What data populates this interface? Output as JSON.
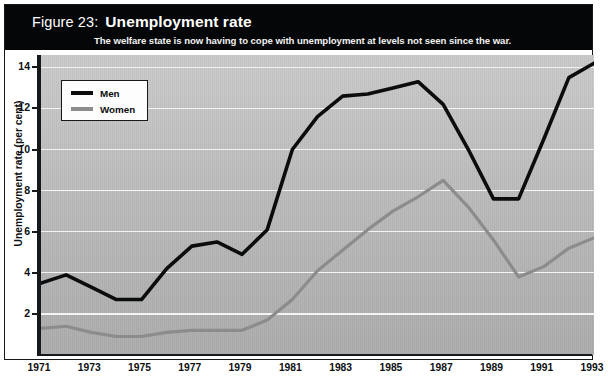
{
  "figure": {
    "number_label": "Figure 23:",
    "title": "Unemployment rate",
    "subtitle": "The welfare state is now having to cope with unemployment at levels not seen since the war."
  },
  "legend": {
    "position": "top-left",
    "entries": [
      {
        "label": "Men",
        "color": "#0a0c0d"
      },
      {
        "label": "Women",
        "color": "#8c8c8c"
      }
    ]
  },
  "axes": {
    "y_title": "Unemployment rate (per cent)",
    "y_ticks": [
      "2",
      "4",
      "6",
      "8",
      "10",
      "12",
      "14"
    ],
    "x_ticks": [
      "1971",
      "1973",
      "1975",
      "1977",
      "1979",
      "1981",
      "1983",
      "1985",
      "1987",
      "1989",
      "1991",
      "1993"
    ]
  },
  "chart_data": {
    "type": "line",
    "title": "Unemployment rate",
    "subtitle": "The welfare state is now having to cope with unemployment at levels not seen since the war.",
    "xlabel": "",
    "ylabel": "Unemployment rate (per cent)",
    "x": [
      1971,
      1972,
      1973,
      1974,
      1975,
      1976,
      1977,
      1978,
      1979,
      1980,
      1981,
      1982,
      1983,
      1984,
      1985,
      1986,
      1987,
      1988,
      1989,
      1990,
      1991,
      1992,
      1993
    ],
    "xlim": [
      1971,
      1993
    ],
    "ylim": [
      0,
      14.6
    ],
    "y_tick_values": [
      2,
      4,
      6,
      8,
      10,
      12,
      14
    ],
    "grid": true,
    "grid_color": "#f4f4f4",
    "series": [
      {
        "name": "Men",
        "color": "#0a0c0d",
        "values": [
          3.5,
          3.9,
          3.3,
          2.7,
          2.7,
          4.2,
          5.3,
          5.5,
          4.9,
          6.1,
          10.0,
          11.6,
          12.6,
          12.7,
          13.0,
          13.3,
          12.2,
          10.0,
          7.6,
          7.6,
          10.5,
          13.5,
          14.2
        ]
      },
      {
        "name": "Women",
        "color": "#8c8c8c",
        "values": [
          1.3,
          1.4,
          1.1,
          0.9,
          0.9,
          1.1,
          1.2,
          1.2,
          1.2,
          1.7,
          2.7,
          4.1,
          5.1,
          6.1,
          7.0,
          7.7,
          8.5,
          7.2,
          5.6,
          3.8,
          4.3,
          5.2,
          5.7
        ]
      }
    ]
  }
}
